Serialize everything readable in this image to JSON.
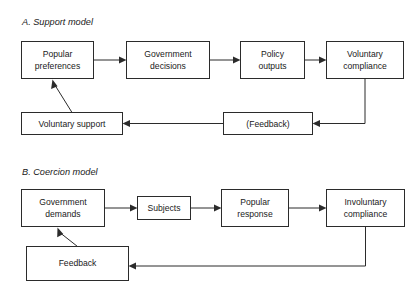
{
  "figure": {
    "colors": {
      "background": "#ffffff",
      "stroke": "#2b2b2b",
      "text": "#1a1a1a",
      "box_fill": "#ffffff"
    }
  },
  "panels": [
    {
      "id": "panel-a",
      "title": "A. Support model",
      "nodes": [
        {
          "id": "popular-preferences",
          "lines": [
            "Popular",
            "preferences"
          ]
        },
        {
          "id": "government-decisions",
          "lines": [
            "Government",
            "decisions"
          ]
        },
        {
          "id": "policy-outputs",
          "lines": [
            "Policy",
            "outputs"
          ]
        },
        {
          "id": "voluntary-compliance",
          "lines": [
            "Voluntary",
            "compliance"
          ]
        },
        {
          "id": "voluntary-support",
          "lines": [
            "Voluntary support"
          ]
        },
        {
          "id": "feedback-a",
          "lines": [
            "(Feedback)"
          ]
        }
      ],
      "edges": [
        {
          "id": "edge-prefs-to-decisions",
          "from": "popular-preferences",
          "to": "government-decisions",
          "style": "horizontal"
        },
        {
          "id": "edge-decisions-to-outputs",
          "from": "government-decisions",
          "to": "policy-outputs",
          "style": "horizontal"
        },
        {
          "id": "edge-outputs-to-compliance",
          "from": "policy-outputs",
          "to": "voluntary-compliance",
          "style": "horizontal"
        },
        {
          "id": "edge-compliance-to-feedback",
          "from": "voluntary-compliance",
          "to": "feedback-a",
          "style": "elbow-down-left"
        },
        {
          "id": "edge-feedback-to-support",
          "from": "feedback-a",
          "to": "voluntary-support",
          "style": "horizontal-left"
        },
        {
          "id": "edge-support-to-prefs",
          "from": "voluntary-support",
          "to": "popular-preferences",
          "style": "diagonal-up-left"
        }
      ]
    },
    {
      "id": "panel-b",
      "title": "B. Coercion model",
      "nodes": [
        {
          "id": "government-demands",
          "lines": [
            "Government",
            "demands"
          ]
        },
        {
          "id": "subjects",
          "lines": [
            "Subjects"
          ]
        },
        {
          "id": "popular-response",
          "lines": [
            "Popular",
            "response"
          ]
        },
        {
          "id": "involuntary-compliance",
          "lines": [
            "Involuntary",
            "compliance"
          ]
        },
        {
          "id": "feedback-b",
          "lines": [
            "Feedback"
          ]
        }
      ],
      "edges": [
        {
          "id": "edge-demands-to-subjects",
          "from": "government-demands",
          "to": "subjects",
          "style": "horizontal"
        },
        {
          "id": "edge-subjects-to-response",
          "from": "subjects",
          "to": "popular-response",
          "style": "horizontal"
        },
        {
          "id": "edge-response-to-compliance",
          "from": "popular-response",
          "to": "involuntary-compliance",
          "style": "horizontal"
        },
        {
          "id": "edge-compliance-to-feedback-b",
          "from": "involuntary-compliance",
          "to": "feedback-b",
          "style": "elbow-down-left"
        },
        {
          "id": "edge-feedback-to-demands",
          "from": "feedback-b",
          "to": "government-demands",
          "style": "diagonal-up-left"
        }
      ]
    }
  ]
}
